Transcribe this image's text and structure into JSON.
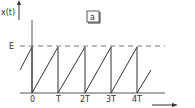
{
  "figure": {
    "panel_label": "a",
    "y_axis_label": "x(t)",
    "level_label": "E",
    "x_ticks": [
      "0",
      "T",
      "2T",
      "3T",
      "4T"
    ],
    "signal": "sawtooth",
    "line_color": "#333333"
  }
}
